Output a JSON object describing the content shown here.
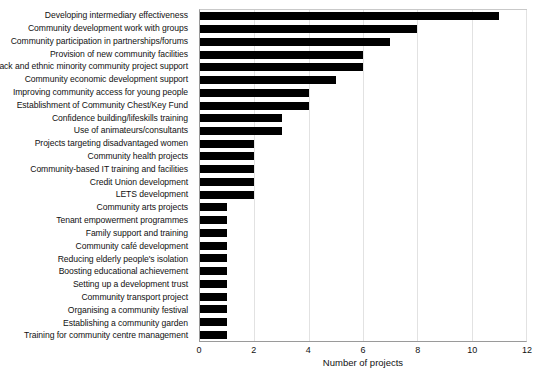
{
  "chart_data": {
    "type": "bar",
    "orientation": "horizontal",
    "title": "",
    "xlabel": "Number of projects",
    "ylabel": "",
    "xlim": [
      0,
      12
    ],
    "xticks": [
      0,
      2,
      4,
      6,
      8,
      10,
      12
    ],
    "grid": true,
    "legend": null,
    "bar_color": "#000000",
    "categories": [
      "Developing intermediary effectiveness",
      "Community development work with groups",
      "Community participation in partnerships/forums",
      "Provision of new community facilities",
      "Black and ethnic minority community project support",
      "Community economic development support",
      "Improving community access for young people",
      "Establishment of Community Chest/Key Fund",
      "Confidence building/lifeskills training",
      "Use of animateurs/consultants",
      "Projects targeting disadvantaged women",
      "Community health projects",
      "Community-based IT training and facilities",
      "Credit Union development",
      "LETS development",
      "Community arts projects",
      "Tenant empowerment programmes",
      "Family support and training",
      "Community café development",
      "Reducing elderly people's isolation",
      "Boosting educational achievement",
      "Setting up a development trust",
      "Community transport project",
      "Organising a community festival",
      "Establishing a community garden",
      "Training for community centre management"
    ],
    "values": [
      11,
      8,
      7,
      6,
      6,
      5,
      4,
      4,
      3,
      3,
      2,
      2,
      2,
      2,
      2,
      1,
      1,
      1,
      1,
      1,
      1,
      1,
      1,
      1,
      1,
      1
    ]
  }
}
